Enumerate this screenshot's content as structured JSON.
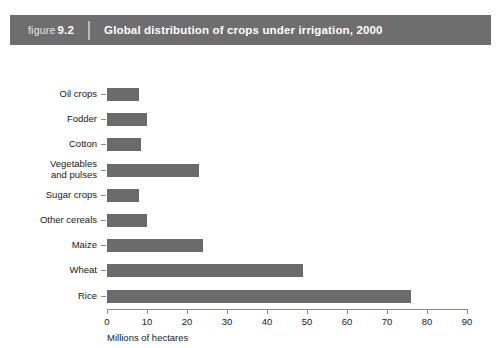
{
  "figure": {
    "label": "figure",
    "number": "9.2",
    "title": "Global distribution of crops under irrigation, 2000"
  },
  "colors": {
    "header_background": "#6e6e6e",
    "header_text": "#ffffff",
    "bar_fill": "#6b6b6b",
    "axis": "#8a8a8a",
    "page_background": "#ffffff"
  },
  "chart_data": {
    "type": "bar",
    "orientation": "horizontal",
    "title": "Global distribution of crops under irrigation, 2000",
    "subtitle": "",
    "categories": [
      "Oil crops",
      "Fodder",
      "Cotton",
      "Vegetables\nand pulses",
      "Sugar crops",
      "Other cereals",
      "Maize",
      "Wheat",
      "Rice"
    ],
    "values": [
      8,
      10,
      8.5,
      23,
      8,
      10,
      24,
      49,
      76
    ],
    "xlabel": "Millions of hectares",
    "ylabel": "",
    "xlim": [
      0,
      90
    ],
    "xticks": [
      0,
      10,
      20,
      30,
      40,
      50,
      60,
      70,
      80,
      90
    ],
    "xtick_labels": [
      "0",
      "10",
      "20",
      "30",
      "40",
      "50",
      "60",
      "70",
      "80",
      "90"
    ],
    "grid": false,
    "legend": null,
    "legend_position": "none",
    "annotations": []
  }
}
